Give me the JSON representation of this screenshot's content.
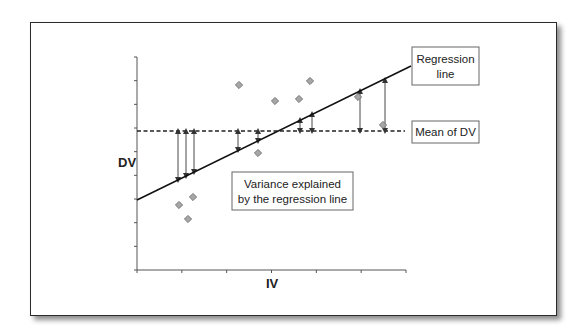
{
  "figure": {
    "y_axis_label": "DV",
    "x_axis_label": "IV",
    "callouts": {
      "regression_line": [
        "Regression",
        "line"
      ],
      "mean_of_dv": "Mean of DV",
      "variance_explained": [
        "Variance explained",
        "by the regression line"
      ]
    }
  },
  "colors": {
    "frame": "#2a2a2a",
    "axis": "#555555",
    "point_fill": "#a6a6a6",
    "point_stroke": "#6e6e6e",
    "line": "#111111",
    "arrow": "#333333"
  },
  "chart_data": {
    "type": "scatter",
    "title": "",
    "xlabel": "IV",
    "ylabel": "DV",
    "axis_ticks": {
      "x_count": 7,
      "y_count": 10
    },
    "grid": false,
    "points_px": [
      [
        179,
        205
      ],
      [
        188,
        219
      ],
      [
        193,
        197
      ],
      [
        239,
        85
      ],
      [
        258,
        153
      ],
      [
        275,
        101
      ],
      [
        299,
        99
      ],
      [
        310,
        81
      ],
      [
        358,
        97
      ],
      [
        383,
        125
      ]
    ],
    "regression_line_px": {
      "x1": 137,
      "y1": 200,
      "x2": 411,
      "y2": 66
    },
    "mean_line_px": {
      "y": 131,
      "x1": 137,
      "x2": 405
    },
    "variance_arrows_px": [
      {
        "x": 178,
        "y1": 131,
        "y2": 180
      },
      {
        "x": 186,
        "y1": 131,
        "y2": 176
      },
      {
        "x": 194,
        "y1": 131,
        "y2": 172
      },
      {
        "x": 238,
        "y1": 131,
        "y2": 150
      },
      {
        "x": 258,
        "y1": 131,
        "y2": 141
      },
      {
        "x": 300,
        "y1": 131,
        "y2": 120
      },
      {
        "x": 312,
        "y1": 131,
        "y2": 114
      },
      {
        "x": 360,
        "y1": 131,
        "y2": 91
      },
      {
        "x": 385,
        "y1": 131,
        "y2": 80
      }
    ]
  }
}
